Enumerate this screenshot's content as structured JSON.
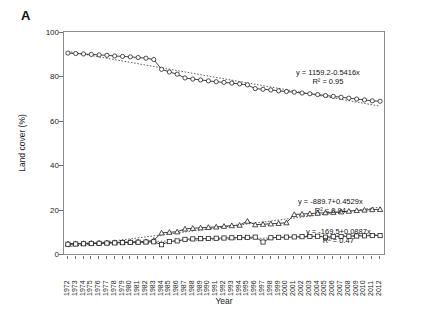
{
  "panel": {
    "label": "A"
  },
  "axes": {
    "ylabel": "Land cover (%)",
    "xlabel": "Year",
    "yticks": [
      0,
      20,
      40,
      60,
      80,
      100
    ],
    "ymin": 0,
    "ymax": 100
  },
  "annotations": [
    {
      "id": "ann-series1",
      "line1": "y = 1159.2-0.5416x",
      "line2": "R² = 0.95"
    },
    {
      "id": "ann-series2",
      "line1": "y = -889.7+0.4529x",
      "line2": "R² = 0.94"
    },
    {
      "id": "ann-series3",
      "line1": "y = -169.5+0.0887x",
      "line2": "R² = 0.47"
    }
  ],
  "chart_data": {
    "type": "line",
    "title": "",
    "xlabel": "Year",
    "ylabel": "Land cover (%)",
    "ylim": [
      0,
      100
    ],
    "grid": false,
    "legend": "none",
    "marker_style": [
      "open-circle",
      "open-triangle",
      "open-square"
    ],
    "trendline": "dotted linear fit per series",
    "categories": [
      "1972",
      "1973",
      "1974",
      "1975",
      "1976",
      "1977",
      "1978",
      "1979",
      "1980",
      "1981",
      "1982",
      "1983",
      "1984",
      "1985",
      "1986",
      "1987",
      "1988",
      "1989",
      "1990",
      "1991",
      "1992",
      "1993",
      "1994",
      "1995",
      "1996",
      "1997",
      "1998",
      "1999",
      "2000",
      "2001",
      "2002",
      "2003",
      "2004",
      "2005",
      "2006",
      "2007",
      "2008",
      "2009",
      "2010",
      "2011",
      "2012"
    ],
    "series": [
      {
        "name": "series-1",
        "marker": "open-circle",
        "equation": "y = 1159.2-0.5416x",
        "r2": 0.95,
        "values": [
          90.5,
          90.3,
          90.1,
          89.9,
          89.7,
          89.5,
          89.2,
          89.0,
          88.8,
          88.5,
          88.2,
          87.6,
          83.2,
          82.0,
          81.0,
          79.3,
          78.8,
          78.4,
          78.0,
          77.6,
          77.3,
          77.0,
          76.6,
          76.2,
          74.5,
          74.2,
          73.9,
          73.5,
          73.2,
          72.9,
          72.5,
          72.2,
          71.8,
          71.4,
          71.0,
          70.6,
          70.2,
          69.8,
          69.4,
          69.0,
          68.8
        ]
      },
      {
        "name": "series-2",
        "marker": "open-triangle",
        "equation": "y = -889.7+0.4529x",
        "r2": 0.94,
        "values": [
          4.6,
          4.7,
          4.8,
          4.9,
          5.0,
          5.1,
          5.2,
          5.3,
          5.4,
          5.5,
          5.6,
          6.2,
          9.5,
          9.8,
          10.0,
          11.3,
          11.6,
          11.8,
          12.0,
          12.2,
          12.5,
          12.8,
          13.0,
          14.8,
          13.2,
          13.4,
          13.6,
          13.8,
          14.1,
          17.8,
          18.0,
          18.2,
          18.4,
          18.6,
          18.8,
          19.0,
          19.3,
          19.6,
          19.8,
          20.0,
          20.1
        ]
      },
      {
        "name": "series-3",
        "marker": "open-square",
        "equation": "y = -169.5+0.0887x",
        "r2": 0.47,
        "values": [
          4.4,
          4.5,
          4.6,
          4.7,
          4.8,
          4.9,
          5.0,
          5.1,
          5.2,
          5.3,
          5.4,
          5.5,
          4.2,
          5.6,
          5.9,
          6.6,
          6.8,
          6.9,
          7.0,
          7.1,
          7.2,
          7.3,
          7.4,
          7.5,
          7.6,
          5.4,
          7.3,
          7.5,
          7.6,
          7.7,
          7.8,
          7.9,
          8.0,
          7.6,
          7.8,
          7.9,
          8.0,
          8.1,
          8.2,
          8.3,
          8.3
        ]
      }
    ]
  }
}
